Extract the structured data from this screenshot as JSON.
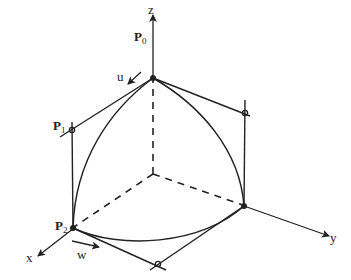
{
  "diagram": {
    "type": "bezier-triangular-patch-on-axes",
    "axes": {
      "x": {
        "label": "x"
      },
      "y": {
        "label": "y"
      },
      "z": {
        "label": "z"
      }
    },
    "points": {
      "p0": {
        "label": "P",
        "sub": "0"
      },
      "p1": {
        "label": "P",
        "sub": "1"
      },
      "p2": {
        "label": "P",
        "sub": "2"
      }
    },
    "directions": {
      "u": {
        "label": "u"
      },
      "w": {
        "label": "w"
      }
    },
    "colors": {
      "ink": "#222222",
      "background": "#ffffff"
    }
  }
}
